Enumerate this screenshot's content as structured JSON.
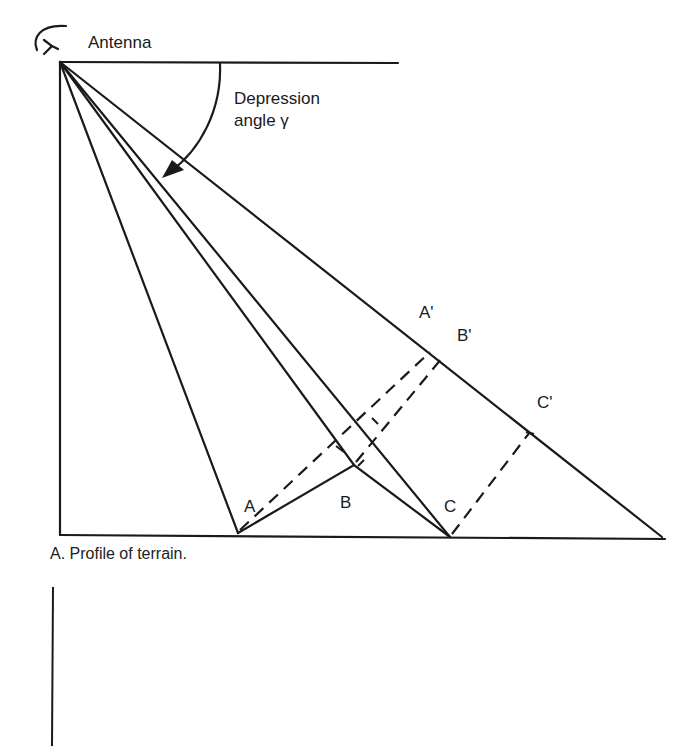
{
  "figure": {
    "antenna_label": "Antenna",
    "depression_label_line1": "Depression",
    "depression_label_line2": "angle γ",
    "caption": "A. Profile of terrain.",
    "points": {
      "A": "A",
      "B": "B",
      "C": "C",
      "A_prime": "A'",
      "B_prime": "B'",
      "C_prime": "C'"
    },
    "colors": {
      "line": "#1a1a1a",
      "background": "#ffffff"
    }
  }
}
